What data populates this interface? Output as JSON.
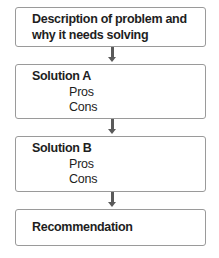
{
  "diagram": {
    "type": "flowchart",
    "boxes": [
      {
        "title_line1": "Description of problem and",
        "title_line2": "why it needs solving"
      },
      {
        "title": "Solution A",
        "items": [
          "Pros",
          "Cons"
        ]
      },
      {
        "title": "Solution B",
        "items": [
          "Pros",
          "Cons"
        ]
      },
      {
        "title": "Recommendation"
      }
    ],
    "colors": {
      "border": "#9a9a9a",
      "arrow": "#5a5a5a",
      "text": "#1e1e1e"
    }
  }
}
